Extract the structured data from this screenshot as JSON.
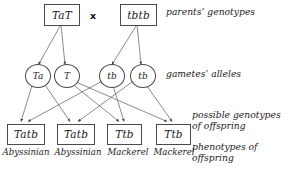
{
  "diagram": {
    "cross_symbol": "x",
    "parents": {
      "side_label": "parents’ genotypes",
      "items": [
        {
          "genotype": "TaT"
        },
        {
          "genotype": "tbtb"
        }
      ]
    },
    "gametes": {
      "side_label": "gametes’ alleles",
      "items": [
        {
          "allele": "Ta"
        },
        {
          "allele": "T"
        },
        {
          "allele": "tb"
        },
        {
          "allele": "tb"
        }
      ]
    },
    "offspring": {
      "side_label_line1": "possible genotypes",
      "side_label_line2": "of offspring",
      "items": [
        {
          "genotype": "Tatb"
        },
        {
          "genotype": "Tatb"
        },
        {
          "genotype": "Ttb"
        },
        {
          "genotype": "Ttb"
        }
      ]
    },
    "phenotypes": {
      "side_label_line1": "phenotypes of",
      "side_label_line2": "offspring",
      "items": [
        {
          "name": "Abyssinian"
        },
        {
          "name": "Abyssinian"
        },
        {
          "name": "Mackerel"
        },
        {
          "name": "Mackerel"
        }
      ]
    },
    "colors": {
      "line": "#4a4a4a",
      "text": "#1a1a1a",
      "background": "#ffffff"
    }
  }
}
